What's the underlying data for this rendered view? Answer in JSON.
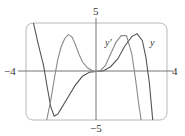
{
  "chart_data": {
    "type": "line",
    "title": "",
    "xlabel": "",
    "ylabel": "",
    "xlim": [
      -4,
      4
    ],
    "ylim": [
      -5,
      5
    ],
    "grid": false,
    "tick_labels": {
      "x_left": "−4",
      "x_right": "4",
      "y_top": "5",
      "y_bottom": "−5"
    },
    "series": [
      {
        "name": "y",
        "color": "#555555",
        "x": [
          -3.6,
          -3.3,
          -3.0,
          -2.8,
          -2.6,
          -2.4,
          -2.2,
          -2.0,
          -1.6,
          -1.2,
          -0.8,
          -0.4,
          0,
          0.4,
          0.8,
          1.2,
          1.6,
          2.0,
          2.3,
          2.6,
          2.8,
          3.0,
          3.2
        ],
        "values": [
          5.2,
          2.8,
          0.6,
          -1.6,
          -3.6,
          -4.6,
          -4.4,
          -3.8,
          -2.6,
          -1.4,
          -0.5,
          -0.08,
          0,
          0.08,
          0.5,
          1.3,
          2.6,
          3.6,
          3.9,
          3.2,
          1.5,
          -1.2,
          -5.2
        ]
      },
      {
        "name": "y'",
        "color": "#8a8a8a",
        "x": [
          -2.85,
          -2.6,
          -2.4,
          -2.2,
          -2.0,
          -1.8,
          -1.6,
          -1.4,
          -1.2,
          -1.0,
          -0.8,
          -0.5,
          -0.2,
          0,
          0.2,
          0.5,
          0.8,
          1.1,
          1.4,
          1.7,
          2.0,
          2.2,
          2.4,
          2.55
        ],
        "values": [
          -5.2,
          -3.0,
          -0.8,
          1.2,
          2.6,
          3.4,
          3.8,
          3.6,
          2.8,
          1.8,
          1.0,
          0.35,
          0.04,
          0,
          0.05,
          0.6,
          1.8,
          3.0,
          3.7,
          3.7,
          1.8,
          -0.6,
          -3.4,
          -5.2
        ]
      }
    ],
    "annotations": [
      {
        "text": "y′",
        "x": 1.3,
        "y": 3.0
      },
      {
        "text": "y",
        "x": 3.35,
        "y": 3.0
      }
    ]
  },
  "labels": {
    "y_top": "5",
    "y_bottom": "−5",
    "x_left": "−4",
    "x_right": "4",
    "curve_y_prime": "y′",
    "curve_y": "y"
  }
}
